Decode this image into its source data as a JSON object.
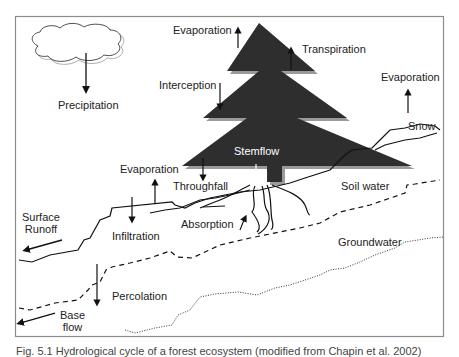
{
  "figure": {
    "labels": {
      "precipitation": "Precipitation",
      "evaporation_top": "Evaporation",
      "transpiration": "Transpiration",
      "interception": "Interception",
      "evaporation_right": "Evaporation",
      "snow": "Snow",
      "stemflow": "Stemflow",
      "evaporation_left": "Evaporation",
      "throughfall": "Throughfall",
      "soil_water": "Soil water",
      "surface_runoff_line1": "Surface",
      "surface_runoff_line2": "Runoff",
      "infiltration": "Infiltration",
      "absorption": "Absorption",
      "groundwater": "Groundwater",
      "percolation": "Percolation",
      "base_flow_line1": "Base",
      "base_flow_line2": "flow"
    },
    "caption": "Fig. 5.1 Hydrological cycle of a forest ecosystem (modified from Chapin et al. 2002)",
    "colors": {
      "tree": "#2e2e2e",
      "tree_shadow": "#9a9a9a",
      "line": "#111111",
      "frame": "#8c8c8c"
    }
  }
}
